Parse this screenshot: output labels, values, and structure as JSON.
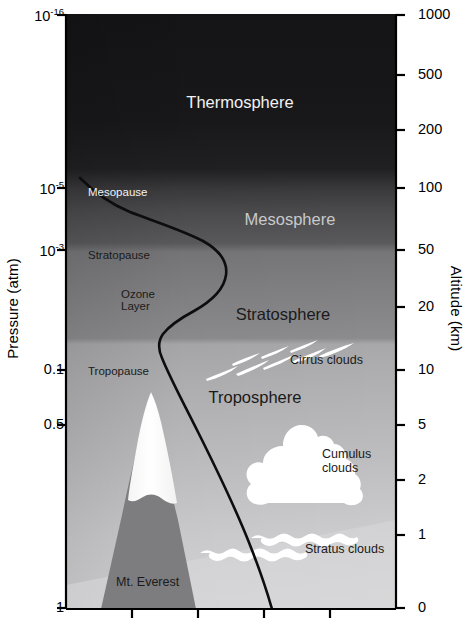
{
  "chart_data": {
    "type": "diagram",
    "xlabel": "Temperature",
    "ylabel": "Pressure (atm)",
    "y2label": "Altitude (km)",
    "y_left_ticks": [
      {
        "label": "10",
        "exp": "-16",
        "y": 15
      },
      {
        "label": "10",
        "exp": "-5",
        "y": 188
      },
      {
        "label": "10",
        "exp": "-3",
        "y": 250
      },
      {
        "label": "0.1",
        "exp": "",
        "y": 370
      },
      {
        "label": "0.5",
        "exp": "",
        "y": 425
      },
      {
        "label": "1",
        "exp": "",
        "y": 608
      }
    ],
    "y_right_ticks": [
      {
        "label": "1000",
        "y": 15
      },
      {
        "label": "500",
        "y": 75
      },
      {
        "label": "200",
        "y": 130
      },
      {
        "label": "100",
        "y": 188
      },
      {
        "label": "50",
        "y": 250
      },
      {
        "label": "20",
        "y": 307
      },
      {
        "label": "10",
        "y": 370
      },
      {
        "label": "5",
        "y": 425
      },
      {
        "label": "2",
        "y": 480
      },
      {
        "label": "1",
        "y": 535
      },
      {
        "label": "0",
        "y": 608
      }
    ],
    "x_ticks_unlabeled": 4,
    "layers": [
      {
        "name": "Thermosphere",
        "x": 240,
        "y": 103,
        "tone": "light",
        "size": "major"
      },
      {
        "name": "Mesosphere",
        "x": 290,
        "y": 220,
        "tone": "mid",
        "size": "major"
      },
      {
        "name": "Stratosphere",
        "x": 283,
        "y": 315,
        "tone": "dark",
        "size": "major"
      },
      {
        "name": "Troposphere",
        "x": 255,
        "y": 398,
        "tone": "dark",
        "size": "major"
      }
    ],
    "boundaries": [
      {
        "name": "Mesopause",
        "x": 88,
        "y": 186,
        "tone": "light"
      },
      {
        "name": "Stratopause",
        "x": 88,
        "y": 249,
        "tone": "dark"
      },
      {
        "name": "Ozone Layer",
        "x": 121,
        "y": 288,
        "tone": "dark",
        "line2": "Layer"
      },
      {
        "name": "Tropopause",
        "x": 88,
        "y": 365,
        "tone": "dark"
      }
    ],
    "clouds": [
      {
        "name": "Cirrus clouds",
        "x": 290,
        "y": 354,
        "tone": "dark"
      },
      {
        "name": "Cumulus",
        "x": 322,
        "y": 448,
        "tone": "dark",
        "line2": "clouds"
      },
      {
        "name": "Stratus clouds",
        "x": 305,
        "y": 543,
        "tone": "dark"
      }
    ],
    "features": [
      {
        "name": "Mt. Everest",
        "x": 116,
        "y": 576,
        "tone": "dark"
      }
    ],
    "curve_description": "Temperature profile: descends from the mesopause at upper-left, bulges right through the mesosphere, returns left through the stratopause and ozone layer, then runs down-right through the troposphere to the surface.",
    "colors": {
      "thermosphere": "#17171a",
      "mesosphere": "#3d3d40",
      "stratosphere": "#8c8c8c",
      "troposphere_top": "#b4b4b4",
      "surface": "#d2d2d2",
      "mountain": "#7a7a7a",
      "snow": "#ffffff",
      "cloud": "#ffffff",
      "axis": "#000000",
      "curve": "#000000"
    }
  },
  "axes": {
    "left_title": "Pressure (atm)",
    "right_title": "Altitude (km)"
  }
}
